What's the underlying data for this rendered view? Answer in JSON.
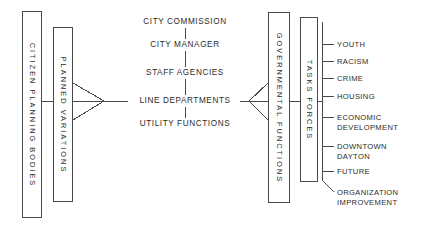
{
  "diagram": {
    "ink_color": "#2b2b2b",
    "box_border_color": "#4a4a4a",
    "background": "#ffffff"
  },
  "left_boxes": [
    {
      "label": "CITIZEN PLANNING BODIES"
    },
    {
      "label": "PLANNED VARIATIONS"
    }
  ],
  "center_column": {
    "items": [
      {
        "label": "CITY COMMISSION"
      },
      {
        "label": "CITY MANAGER"
      },
      {
        "label": "STAFF AGENCIES"
      },
      {
        "label": "LINE DEPARTMENTS"
      },
      {
        "label": "UTILITY FUNCTIONS"
      }
    ]
  },
  "right_boxes": [
    {
      "label": "GOVERNMENTAL FUNCTIONS"
    },
    {
      "label": "TASKS FORCES"
    }
  ],
  "task_force_items": [
    {
      "line1": "YOUTH",
      "line2": ""
    },
    {
      "line1": "RACISM",
      "line2": ""
    },
    {
      "line1": "CRIME",
      "line2": ""
    },
    {
      "line1": "HOUSING",
      "line2": ""
    },
    {
      "line1": "ECONOMIC",
      "line2": "DEVELOPMENT"
    },
    {
      "line1": "DOWNTOWN",
      "line2": "DAYTON"
    },
    {
      "line1": "FUTURE",
      "line2": ""
    },
    {
      "line1": "ORGANIZATION",
      "line2": "IMPROVEMENT"
    }
  ]
}
